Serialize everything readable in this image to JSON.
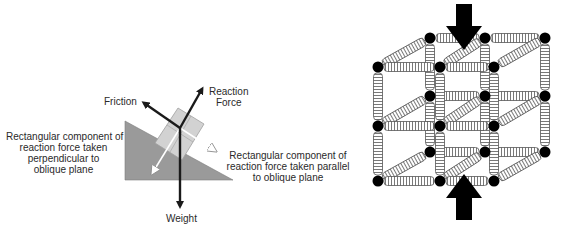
{
  "left_diagram": {
    "title": "Forces on a block on an oblique plane",
    "labels": {
      "friction": "Friction",
      "reaction_line1": "Reaction",
      "reaction_line2": "Force",
      "weight": "Weight",
      "perp_line1": "Rectangular component of",
      "perp_line2": "reaction force taken",
      "perp_line3": "perpendicular to",
      "perp_line4": "oblique plane",
      "para_line1": "Rectangular component of",
      "para_line2": "reaction force taken parallel",
      "para_line3": "to oblique plane"
    },
    "colors": {
      "plane": "#9a9a9a",
      "block": "#d2d2d2",
      "force_arrow": "#1a1a1a",
      "component_arrow": "#ffffff"
    }
  },
  "right_diagram": {
    "title": "Spring lattice under vertical compression",
    "front_nodes_x": [
      378,
      440,
      494
    ],
    "front_nodes_y": [
      67,
      126,
      181
    ],
    "back_nodes_x": [
      430,
      485,
      545
    ],
    "back_nodes_y": [
      38,
      96,
      152
    ],
    "load_arrows": [
      "top-compression-arrow",
      "bottom-compression-arrow"
    ],
    "colors": {
      "node": "#000000",
      "spring_fill": "#ffffff",
      "spring_stroke": "#555555",
      "arrow": "#000000"
    }
  }
}
